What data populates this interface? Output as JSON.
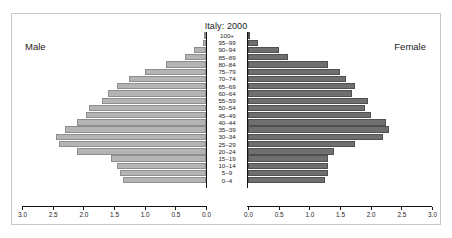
{
  "figure": {
    "title": "Italy: 2000",
    "male_label": "Male",
    "female_label": "Female",
    "x_axis_title": "Population (in millions)"
  },
  "chart_data": {
    "type": "bar",
    "subtype": "population-pyramid",
    "title": "Italy: 2000",
    "xlabel": "Population (in millions)",
    "ylabel": "",
    "grid": false,
    "legend": [
      "Male",
      "Female"
    ],
    "legend_position": "top-left and top-right (side annotations)",
    "xlim_left": [
      3.0,
      0.0
    ],
    "xlim_right": [
      0.0,
      3.0
    ],
    "x_ticks_left": [
      "3.0",
      "2.5",
      "2.0",
      "1.5",
      "1.0",
      "0.5",
      "0.0"
    ],
    "x_ticks_right": [
      "0.0",
      "0.5",
      "1.0",
      "1.5",
      "2.0",
      "2.5",
      "3.0"
    ],
    "categories": [
      "100+",
      "95–99",
      "90–94",
      "85–89",
      "80–84",
      "75–79",
      "70–74",
      "65–69",
      "60–64",
      "55–59",
      "50–54",
      "45–49",
      "40–44",
      "35–39",
      "30–34",
      "25–29",
      "20–24",
      "15–19",
      "10–14",
      "5–9",
      "0–4"
    ],
    "series": [
      {
        "name": "Male",
        "color": "#b4b4b4",
        "values": [
          0.01,
          0.05,
          0.2,
          0.35,
          0.65,
          1.0,
          1.25,
          1.45,
          1.6,
          1.7,
          1.9,
          1.95,
          2.1,
          2.3,
          2.45,
          2.4,
          2.1,
          1.55,
          1.45,
          1.4,
          1.35
        ]
      },
      {
        "name": "Female",
        "color": "#6f6f6f",
        "values": [
          0.03,
          0.17,
          0.5,
          0.65,
          1.3,
          1.5,
          1.6,
          1.75,
          1.7,
          1.95,
          1.9,
          2.0,
          2.25,
          2.3,
          2.2,
          1.75,
          1.4,
          1.3,
          1.3,
          1.3,
          1.25
        ]
      }
    ]
  }
}
